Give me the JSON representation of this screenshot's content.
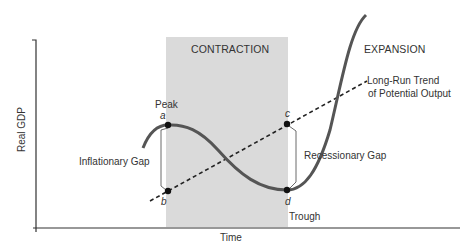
{
  "diagram": {
    "type": "business-cycle",
    "axes": {
      "x_label": "Time",
      "y_label": "Real GDP"
    },
    "regions": {
      "contraction_label": "CONTRACTION",
      "expansion_label": "EXPANSION"
    },
    "trend_line": {
      "label_line1": "Long-Run Trend",
      "label_line2": "of Potential Output"
    },
    "points": {
      "peak_label": "Peak",
      "a": "a",
      "b": "b",
      "c": "c",
      "d": "d",
      "trough_label": "Trough"
    },
    "gaps": {
      "inflationary": "Inflationary Gap",
      "recessionary": "Recessionary Gap"
    },
    "colors": {
      "shade": "#dadada",
      "curve": "#555555",
      "line": "#222222",
      "text": "#333333"
    }
  }
}
